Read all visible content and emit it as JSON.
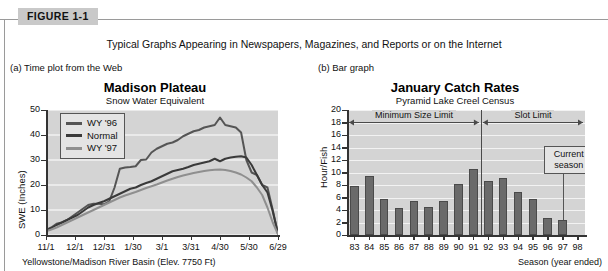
{
  "figure": {
    "badge": "FIGURE 1-1",
    "caption": "Typical Graphs Appearing in Newspapers, Magazines, and Reports or on the Internet"
  },
  "panels": [
    {
      "key": "a",
      "label": "(a) Time plot from the Web"
    },
    {
      "key": "b",
      "label": "(b) Bar graph"
    }
  ],
  "chart_data": [
    {
      "type": "line",
      "panel": "(a) Time plot from the Web",
      "title": "Madison Plateau",
      "subtitle": "Snow Water Equivalent",
      "xlabel": "Yellowstone/Madison River Basin (Elev. 7750 Ft)",
      "ylabel": "SWE (Inches)",
      "ylim": [
        0,
        50
      ],
      "yticks": [
        0,
        10,
        20,
        30,
        40,
        50
      ],
      "xticklabels": [
        "11/1",
        "12/1",
        "12/31",
        "1/30",
        "3/1",
        "3/31",
        "4/30",
        "5/30",
        "6/29"
      ],
      "grid": true,
      "legend_position": "top-left",
      "series": [
        {
          "name": "WY '96",
          "color": "#555555",
          "values": [
            2.0,
            3.0,
            4.5,
            5.0,
            6.0,
            7.5,
            9.0,
            10.5,
            12.0,
            12.5,
            12.5,
            12.3,
            13.5,
            19.0,
            26.5,
            27.0,
            27.2,
            27.5,
            30.0,
            30.2,
            33.0,
            34.5,
            35.5,
            36.5,
            37.0,
            38.0,
            39.5,
            40.5,
            41.5,
            42.0,
            43.0,
            43.5,
            44.0,
            47.0,
            44.0,
            43.5,
            43.0,
            41.0,
            30.0,
            25.0,
            24.0,
            20.0,
            19.0,
            10.0,
            0.5
          ]
        },
        {
          "name": "Normal",
          "color": "#3a3a3a",
          "values": [
            1.8,
            2.8,
            4.0,
            5.0,
            6.0,
            7.0,
            8.0,
            9.5,
            11.0,
            12.0,
            12.8,
            13.5,
            14.5,
            15.5,
            16.5,
            17.5,
            18.5,
            19.0,
            20.0,
            20.8,
            21.5,
            22.5,
            23.5,
            24.5,
            25.5,
            26.0,
            26.5,
            27.2,
            28.0,
            28.5,
            29.0,
            29.5,
            30.5,
            29.5,
            30.5,
            31.0,
            31.3,
            31.5,
            31.0,
            28.0,
            24.0,
            20.0,
            17.0,
            9.5,
            0.5
          ]
        },
        {
          "name": "WY '97",
          "color": "#8f8f8f",
          "values": [
            1.5,
            2.2,
            3.0,
            4.0,
            5.0,
            6.0,
            7.0,
            8.0,
            9.0,
            10.0,
            11.0,
            12.0,
            13.0,
            14.0,
            15.0,
            15.8,
            16.5,
            17.2,
            18.0,
            18.8,
            19.5,
            20.2,
            21.0,
            21.8,
            22.5,
            23.2,
            23.8,
            24.3,
            24.8,
            25.2,
            25.6,
            25.9,
            26.1,
            26.2,
            26.0,
            25.6,
            25.0,
            24.2,
            23.0,
            21.5,
            19.0,
            16.0,
            11.0,
            5.0,
            0.3
          ]
        }
      ]
    },
    {
      "type": "bar",
      "panel": "(b) Bar graph",
      "title": "January Catch Rates",
      "subtitle": "Pyramid Lake Creel Census",
      "xlabel": "Season (year ended)",
      "ylabel": "Hour/Fish",
      "ylim": [
        0,
        20
      ],
      "yticks": [
        0,
        2,
        4,
        6,
        8,
        10,
        12,
        14,
        16,
        18,
        20
      ],
      "categories": [
        "83",
        "84",
        "85",
        "86",
        "87",
        "88",
        "89",
        "90",
        "91",
        "92",
        "93",
        "94",
        "95",
        "96",
        "97",
        "98"
      ],
      "values": [
        7.8,
        9.4,
        5.8,
        4.3,
        5.4,
        4.5,
        5.5,
        8.2,
        10.6,
        8.6,
        9.2,
        6.9,
        5.8,
        2.8,
        2.4,
        0
      ],
      "bar_color": "#6a6a6a",
      "grid": true,
      "annotations": [
        {
          "name": "minimum-size-limit",
          "text": "Minimum Size Limit",
          "span": [
            "83",
            "91"
          ]
        },
        {
          "name": "slot-limit",
          "text": "Slot Limit",
          "span": [
            "92",
            "98"
          ]
        },
        {
          "name": "current-season",
          "text": "Current season",
          "points_to": "97"
        }
      ],
      "divider_after_category": "91"
    }
  ]
}
